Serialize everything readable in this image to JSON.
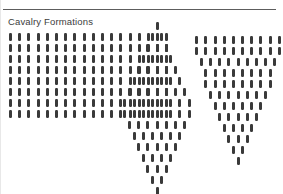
{
  "page": {
    "title": "Cavalry Formations",
    "background_color": "#ffffff",
    "rule_color": "#5d5d5d",
    "unit_color": "#3a3a3a",
    "text_color": "#3c3c3c"
  },
  "formations": [
    {
      "name": "rectangular-block",
      "shape": "rectangle",
      "rows": [
        18,
        18,
        18,
        18,
        18,
        18,
        18,
        18
      ],
      "align": "left",
      "total_units": 144
    },
    {
      "name": "diamond",
      "shape": "rhombus",
      "rows": [
        1,
        2,
        3,
        4,
        5,
        6,
        7,
        8,
        8,
        7,
        6,
        5,
        4,
        3,
        2,
        1
      ],
      "align": "center",
      "total_units": 72
    },
    {
      "name": "wedge",
      "shape": "inverted-triangle",
      "rows": [
        10,
        10,
        9,
        8,
        8,
        7,
        6,
        5,
        4,
        3,
        2,
        1
      ],
      "align": "center",
      "total_units": 73
    }
  ],
  "glyph": {
    "name": "cavalry-unit-mark",
    "width_px": 3,
    "height_px": 8
  }
}
